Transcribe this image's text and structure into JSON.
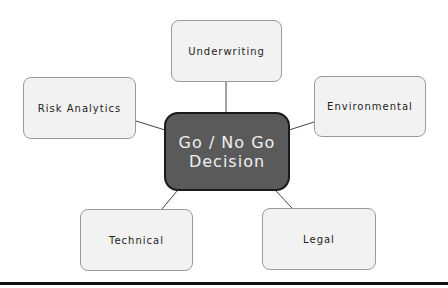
{
  "diagram": {
    "center": {
      "line1": "Go / No Go",
      "line2": "Decision"
    },
    "nodes": [
      {
        "id": "underwriting",
        "label": "Underwriting"
      },
      {
        "id": "risk-analytics",
        "label": "Risk Analytics"
      },
      {
        "id": "environmental",
        "label": "Environmental"
      },
      {
        "id": "technical",
        "label": "Technical"
      },
      {
        "id": "legal",
        "label": "Legal"
      }
    ]
  },
  "colors": {
    "center_fill": "#5a5a5a",
    "node_fill": "#f2f2f2",
    "connector": "#444444"
  }
}
